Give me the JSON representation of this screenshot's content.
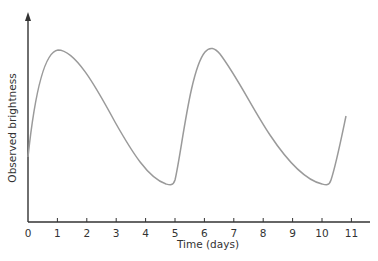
{
  "chart_data": {
    "type": "line",
    "title": "",
    "xlabel": "Time (days)",
    "ylabel": "Observed brightness",
    "x_ticks": [
      "0",
      "1",
      "2",
      "3",
      "4",
      "5",
      "6",
      "7",
      "8",
      "9",
      "10",
      "11"
    ],
    "xlim": [
      0,
      11.5
    ],
    "y_ticks": [],
    "grid": false,
    "legend": null,
    "series": [
      {
        "name": "Cepheid light curve",
        "color": "#9a9a9a",
        "x": [
          0,
          1.0,
          2.0,
          3.0,
          4.0,
          4.85,
          5.4,
          6.2,
          7.0,
          8.0,
          9.0,
          10.1,
          10.75
        ],
        "y": [
          0.38,
          1.0,
          0.85,
          0.55,
          0.27,
          0.22,
          0.6,
          1.0,
          0.85,
          0.53,
          0.28,
          0.22,
          0.58
        ]
      }
    ]
  },
  "colors": {
    "axis": "#333333",
    "curve": "#9a9a9a"
  }
}
